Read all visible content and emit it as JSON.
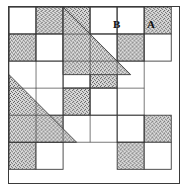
{
  "figure": {
    "kind": "geometric-pattern-block",
    "grid": {
      "columns": 5,
      "rows": 5,
      "cell": 34,
      "origin_x": 9,
      "origin_y": 7
    },
    "colors": {
      "background": "#ffffff",
      "stipple_base": "#d9d9d9",
      "stipple_dot": "#4a4a4a",
      "line": "#3a3a3a",
      "label": "#111111"
    },
    "labels": [
      {
        "id": "label-b",
        "text": "B",
        "col": 3,
        "row": 0
      },
      {
        "id": "label-a",
        "text": "A",
        "col": 4,
        "row": 0
      }
    ],
    "squares": [
      {
        "col": 0,
        "row": 0,
        "fill": "plain"
      },
      {
        "col": 1,
        "row": 0,
        "fill": "stipple"
      },
      {
        "col": 2,
        "row": 0,
        "fill": "stipple"
      },
      {
        "col": 3,
        "row": 0,
        "fill": "plain"
      },
      {
        "col": 4,
        "row": 0,
        "fill": "plain"
      },
      {
        "col": 5,
        "row": 0,
        "fill": "stipple"
      },
      {
        "col": 0,
        "row": 1,
        "fill": "stipple"
      },
      {
        "col": 1,
        "row": 1,
        "fill": "plain"
      },
      {
        "col": 2,
        "row": 1,
        "fill": "stipple"
      },
      {
        "col": 3,
        "row": 1,
        "fill": "plain"
      },
      {
        "col": 4,
        "row": 1,
        "fill": "stipple"
      },
      {
        "col": 5,
        "row": 1,
        "fill": "plain"
      },
      {
        "col": 2,
        "row": 2,
        "fill": "plain"
      },
      {
        "col": 3,
        "row": 2,
        "fill": "stipple"
      },
      {
        "col": 2,
        "row": 3,
        "fill": "stipple"
      },
      {
        "col": 3,
        "row": 3,
        "fill": "plain"
      },
      {
        "col": 0,
        "row": 4,
        "fill": "plain"
      },
      {
        "col": 1,
        "row": 4,
        "fill": "stipple"
      },
      {
        "col": 4,
        "row": 4,
        "fill": "plain"
      },
      {
        "col": 5,
        "row": 4,
        "fill": "stipple"
      },
      {
        "col": 0,
        "row": 5,
        "fill": "stipple"
      },
      {
        "col": 1,
        "row": 5,
        "fill": "plain"
      },
      {
        "col": 4,
        "row": 5,
        "fill": "stipple"
      },
      {
        "col": 5,
        "row": 5,
        "fill": "plain"
      }
    ],
    "triangles": [
      {
        "id": "upper-triangle",
        "note": "Large stippled right triangle, top band running upper-left to center-right",
        "points": "col2,row0 col2,row2 col4,row2"
      },
      {
        "id": "lower-triangle",
        "note": "Large stippled right triangle, lower band running center-left to bottom-right",
        "points": "col0,row2 col0,row4 col2,row4"
      }
    ]
  }
}
